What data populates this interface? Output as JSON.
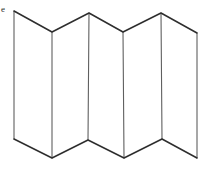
{
  "figure": {
    "label": "e",
    "background_color": "#ffffff",
    "edge_line_color": "#2e2e2e",
    "fold_line_color": "#5f5f5f",
    "edge_line_width": 1.5,
    "fold_line_width": 1.1,
    "top_vertices": [
      [
        14,
        11
      ],
      [
        52,
        32
      ],
      [
        89,
        13
      ],
      [
        123,
        32
      ],
      [
        161,
        13
      ],
      [
        197,
        33
      ]
    ],
    "bottom_vertices": [
      [
        14,
        139
      ],
      [
        52,
        158
      ],
      [
        88,
        140
      ],
      [
        124,
        158
      ],
      [
        162,
        139
      ],
      [
        197,
        158
      ]
    ]
  }
}
